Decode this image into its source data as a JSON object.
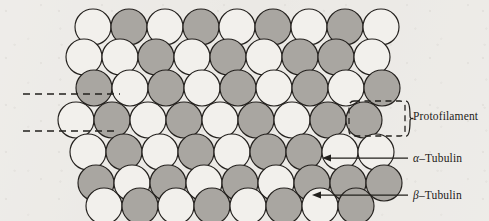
{
  "figure": {
    "background_color": "#eceae6"
  },
  "legend": {
    "protofilament": {
      "label": "Protofilament",
      "marker": "dashed-bracket"
    },
    "alpha_tubulin": {
      "greek": "α",
      "separator": "–",
      "name": "Tubulin",
      "full": "α–Tubulin",
      "marker": "arrow"
    },
    "beta_tubulin": {
      "greek": "β",
      "separator": "–",
      "name": "Tubulin",
      "full": "β–Tubulin",
      "marker": "arrow"
    }
  },
  "colors": {
    "alpha_fill": "#f2f0ec",
    "beta_fill": "#a9a6a1",
    "outline": "#24211e",
    "background": "#eceae6",
    "ink": "#1d1b19"
  },
  "chart_data": {
    "type": "diagram",
    "subunit_radius": 18.0,
    "row_pitch": 33.0,
    "column_pitch": 36.0,
    "row_x_shift": -9.0,
    "rows": [
      {
        "index": 0,
        "y": 27,
        "x_start": 93,
        "count": 9,
        "pattern": [
          "alpha",
          "beta",
          "alpha",
          "beta",
          "alpha",
          "beta",
          "alpha",
          "beta",
          "alpha"
        ]
      },
      {
        "index": 1,
        "y": 57,
        "x_start": 84,
        "count": 9,
        "pattern": [
          "alpha",
          "alpha",
          "beta",
          "alpha",
          "beta",
          "alpha",
          "beta",
          "beta",
          "alpha"
        ]
      },
      {
        "index": 2,
        "y": 88,
        "x_start": 94,
        "count": 9,
        "pattern": [
          "beta",
          "alpha",
          "beta",
          "alpha",
          "beta",
          "alpha",
          "beta",
          "alpha",
          "beta"
        ]
      },
      {
        "index": 3,
        "y": 120,
        "x_start": 76,
        "count": 9,
        "pattern": [
          "alpha",
          "beta",
          "alpha",
          "beta",
          "alpha",
          "beta",
          "alpha",
          "beta",
          "beta"
        ]
      },
      {
        "index": 4,
        "y": 152,
        "x_start": 88,
        "count": 9,
        "pattern": [
          "alpha",
          "beta",
          "alpha",
          "beta",
          "alpha",
          "beta",
          "beta",
          "alpha",
          "alpha"
        ]
      },
      {
        "index": 5,
        "y": 183,
        "x_start": 96,
        "count": 9,
        "pattern": [
          "beta",
          "alpha",
          "beta",
          "alpha",
          "beta",
          "alpha",
          "beta",
          "beta",
          "beta"
        ]
      },
      {
        "index": 6,
        "y": 206,
        "x_start": 104,
        "count": 8,
        "pattern": [
          "alpha",
          "beta",
          "alpha",
          "beta",
          "alpha",
          "beta",
          "alpha",
          "beta"
        ]
      }
    ],
    "annotations": [
      {
        "kind": "guide-line",
        "style": "dashed",
        "x1": 23,
        "y1": 94,
        "x2": 120,
        "y2": 94
      },
      {
        "kind": "guide-line",
        "style": "dashed",
        "x1": 23,
        "y1": 131,
        "x2": 116,
        "y2": 131
      },
      {
        "kind": "dashed-box",
        "x": 349,
        "y": 101,
        "width": 56,
        "height": 35,
        "label": "Protofilament"
      },
      {
        "kind": "arrow",
        "label": "α–Tubulin",
        "from_x": 408,
        "from_y": 158,
        "to_x": 322,
        "to_y": 158,
        "points_to": "alpha"
      },
      {
        "kind": "arrow",
        "label": "β–Tubulin",
        "from_x": 408,
        "from_y": 195,
        "to_x": 312,
        "to_y": 195,
        "points_to": "beta"
      }
    ],
    "legend_position": "right"
  }
}
